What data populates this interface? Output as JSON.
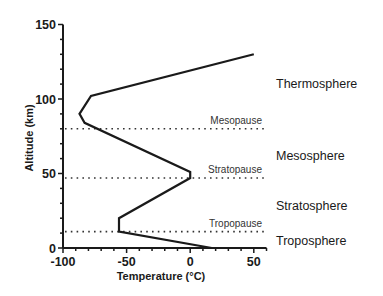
{
  "chart_data": {
    "type": "line",
    "title": "",
    "xlabel": "Temperature (°C)",
    "ylabel": "Altitude (km)",
    "xlim": [
      -100,
      60
    ],
    "ylim": [
      0,
      150
    ],
    "xticks": [
      -100,
      -50,
      0,
      50
    ],
    "yticks": [
      0,
      50,
      100,
      150
    ],
    "x_minor_step": 10,
    "y_minor_step": 10,
    "grid": false,
    "legend": null,
    "series": [
      {
        "name": "Temperature profile",
        "color": "#1a1a1a",
        "points": [
          {
            "temp": 17,
            "alt": 0
          },
          {
            "temp": -56,
            "alt": 11
          },
          {
            "temp": -56,
            "alt": 20
          },
          {
            "temp": 0,
            "alt": 47
          },
          {
            "temp": 0,
            "alt": 51
          },
          {
            "temp": -83,
            "alt": 84
          },
          {
            "temp": -87,
            "alt": 90
          },
          {
            "temp": -78,
            "alt": 102
          },
          {
            "temp": 50,
            "alt": 130
          }
        ]
      }
    ],
    "boundaries": [
      {
        "name": "Tropopause",
        "alt": 11
      },
      {
        "name": "Stratopause",
        "alt": 47
      },
      {
        "name": "Mesopause",
        "alt": 80
      }
    ],
    "layers": [
      {
        "name": "Troposphere",
        "label_alt": 5
      },
      {
        "name": "Stratosphere",
        "label_alt": 28
      },
      {
        "name": "Mesosphere",
        "label_alt": 62
      },
      {
        "name": "Thermosphere",
        "label_alt": 110
      }
    ]
  }
}
